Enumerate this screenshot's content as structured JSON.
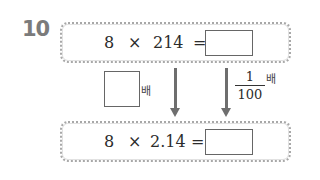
{
  "problem": {
    "number": "10",
    "top_equation": {
      "a": "8",
      "op": "×",
      "b": "214",
      "eq": "=",
      "answer": ""
    },
    "bottom_equation": {
      "a": "8",
      "op": "×",
      "b": "2.14",
      "eq": "=",
      "answer": ""
    },
    "left_transform": {
      "blank_value": "",
      "suffix": "배"
    },
    "right_transform": {
      "numerator": "1",
      "denominator": "100",
      "suffix": "배"
    },
    "colors": {
      "number": "#7b7b7b",
      "box_border": "#a8a8a8",
      "arrow": "#6e6e6e"
    }
  }
}
